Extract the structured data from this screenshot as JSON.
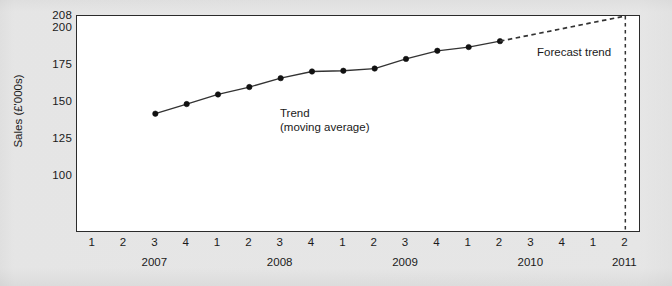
{
  "chart_data": {
    "type": "line",
    "title": "",
    "xlabel": "",
    "ylabel": "Sales (£'000s)",
    "ylim": [
      88,
      208
    ],
    "yticks": [
      208,
      200,
      175,
      150,
      125,
      100
    ],
    "grid": false,
    "legend": "none",
    "x_quarter_labels": [
      "1",
      "2",
      "3",
      "4",
      "1",
      "2",
      "3",
      "4",
      "1",
      "2",
      "3",
      "4",
      "1",
      "2",
      "3",
      "4",
      "1",
      "2"
    ],
    "x_year_labels": [
      "2007",
      "2008",
      "2009",
      "2010",
      "2011"
    ],
    "x_year_positions": [
      3,
      7,
      11,
      15,
      18
    ],
    "series": [
      {
        "name": "Trend (moving average)",
        "style": "solid-with-markers",
        "x": [
          "2007 Q3",
          "2007 Q4",
          "2008 Q1",
          "2008 Q2",
          "2008 Q3",
          "2008 Q4",
          "2009 Q1",
          "2009 Q2",
          "2009 Q3",
          "2009 Q4",
          "2010 Q1",
          "2010 Q2"
        ],
        "x_index": [
          3,
          4,
          5,
          6,
          7,
          8,
          9,
          10,
          11,
          12,
          13,
          14
        ],
        "values": [
          142,
          148.5,
          155,
          160,
          166,
          170.5,
          171,
          172.5,
          179,
          184.5,
          187,
          191
        ]
      },
      {
        "name": "Forecast trend",
        "style": "dashed",
        "x": [
          "2010 Q2",
          "2011 Q2"
        ],
        "x_index": [
          14,
          18
        ],
        "values": [
          191,
          208
        ]
      }
    ],
    "annotations": [
      {
        "name": "trend",
        "text_line1": "Trend",
        "text_line2": "(moving average)"
      },
      {
        "name": "forecast",
        "text_line1": "Forecast trend",
        "text_line2": ""
      }
    ],
    "vertical_reference_line": {
      "at_x": "2011 Q2",
      "x_index": 18,
      "style": "dashed",
      "from": 88,
      "to": 208
    }
  },
  "axes": {
    "y_title": "Sales (£'000s)",
    "y_tick_labels": [
      "208",
      "200",
      "175",
      "150",
      "125",
      "100"
    ],
    "x_tick_labels": [
      "1",
      "2",
      "3",
      "4",
      "1",
      "2",
      "3",
      "4",
      "1",
      "2",
      "3",
      "4",
      "1",
      "2",
      "3",
      "4",
      "1",
      "2"
    ],
    "x_year_labels": [
      "2007",
      "2008",
      "2009",
      "2010",
      "2011"
    ]
  },
  "labels": {
    "trend_line1": "Trend",
    "trend_line2": "(moving average)",
    "forecast": "Forecast trend"
  },
  "colors": {
    "page_background": "#e2e2e2",
    "plot_background": "#ffffff",
    "axis": "#2b2b2b",
    "line": "#333333",
    "marker": "#111111",
    "text": "#1a1a1a"
  }
}
